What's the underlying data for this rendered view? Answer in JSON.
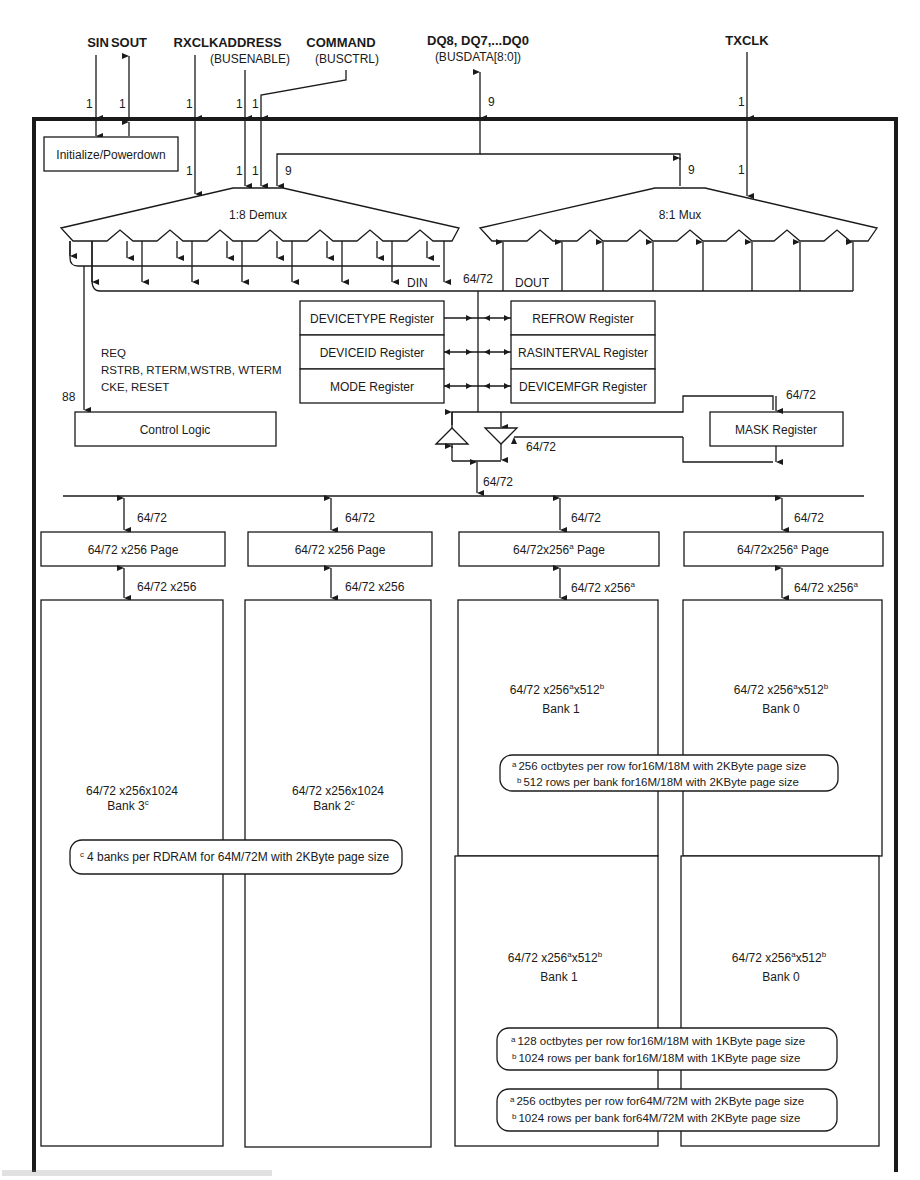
{
  "diagram": {
    "top_signals": [
      {
        "id": "sin",
        "label": "SIN",
        "width": "1"
      },
      {
        "id": "sout",
        "label": "SOUT",
        "width": "1"
      },
      {
        "id": "rxclk",
        "label": "RXCLK",
        "width": "1"
      },
      {
        "id": "address",
        "label": "ADDRESS",
        "sublabel": "(BUSENABLE)",
        "width": "1"
      },
      {
        "id": "command",
        "label": "COMMAND",
        "sublabel": "(BUSCTRL)",
        "width": "1"
      },
      {
        "id": "dq",
        "label": "DQ8, DQ7,...DQ0",
        "sublabel": "(BUSDATA[8:0])",
        "width": "9"
      },
      {
        "id": "txclk",
        "label": "TXCLK",
        "width": "1"
      }
    ],
    "inner_widths": {
      "rxclk": "1",
      "address": "1",
      "command": "1",
      "data_to_demux": "9",
      "data_to_mux": "9",
      "txclk": "1"
    },
    "blocks": {
      "init": "Initialize/Powerdown",
      "demux": "1:8 Demux",
      "mux": "8:1 Mux",
      "din": "DIN",
      "dout": "DOUT",
      "internal_bus": "64/72",
      "control_logic": "Control Logic",
      "control_width": "88",
      "control_signals": [
        "REQ",
        "RSTRB, RTERM,WSTRB, WTERM",
        "CKE, RESET"
      ],
      "mask_register": "MASK Register",
      "mask_in_width": "64/72",
      "mask_out_width": "64/72",
      "bus_to_banks_width": "64/72"
    },
    "registers_left": [
      "DEVICETYPE Register",
      "DEVICEID Register",
      "MODE Register"
    ],
    "registers_right": [
      "REFROW Register",
      "RASINTERVAL Register",
      "DEVICEMFGR Register"
    ],
    "columns": [
      {
        "bus_width": "64/72",
        "page": "64/72 x256 Page",
        "page_width": "64/72 x256",
        "bank_size": "64/72 x256x1024",
        "bank_name": "Bank 3",
        "bank_sup": "c"
      },
      {
        "bus_width": "64/72",
        "page": "64/72 x256 Page",
        "page_width": "64/72 x256",
        "bank_size": "64/72 x256x1024",
        "bank_name": "Bank 2",
        "bank_sup": "c"
      },
      {
        "bus_width": "64/72",
        "page": "64/72x256",
        "page_sup": "a",
        "page_suffix": " Page",
        "page_width": "64/72 x256",
        "page_width_sup": "a",
        "upper_bank_size": "64/72 x256",
        "upper_bank_sup1": "a",
        "upper_bank_mid": "x512",
        "upper_bank_sup2": "b",
        "upper_bank_name": "Bank 1",
        "lower_bank_size": "64/72 x256",
        "lower_bank_sup1": "a",
        "lower_bank_mid": "x512",
        "lower_bank_sup2": "b",
        "lower_bank_name": "Bank 1"
      },
      {
        "bus_width": "64/72",
        "page": "64/72x256",
        "page_sup": "a",
        "page_suffix": " Page",
        "page_width": "64/72 x256",
        "page_width_sup": "a",
        "upper_bank_size": "64/72 x256",
        "upper_bank_sup1": "a",
        "upper_bank_mid": "x512",
        "upper_bank_sup2": "b",
        "upper_bank_name": "Bank 0",
        "lower_bank_size": "64/72 x256",
        "lower_bank_sup1": "a",
        "lower_bank_mid": "x512",
        "lower_bank_sup2": "b",
        "lower_bank_name": "Bank 0"
      }
    ],
    "notes": {
      "c_note": {
        "mark": "c",
        "text": "4 banks per RDRAM for 64M/72M with 2KByte page size"
      },
      "upper_ab": [
        {
          "mark": "a",
          "text": "256 octbytes per row for16M/18M with 2KByte page size"
        },
        {
          "mark": "b",
          "text": "512 rows per bank for16M/18M with 2KByte page size"
        }
      ],
      "lower_ab_1k": [
        {
          "mark": "a",
          "text": "128 octbytes per row for16M/18M with 1KByte page size"
        },
        {
          "mark": "b",
          "text": "1024 rows per bank for16M/18M with 1KByte page size"
        }
      ],
      "lower_ab_2k": [
        {
          "mark": "a",
          "text": "256 octbytes per row for64M/72M with 2KByte page size"
        },
        {
          "mark": "b",
          "text": "1024 rows per bank for64M/72M with 2KByte page size"
        }
      ]
    }
  }
}
